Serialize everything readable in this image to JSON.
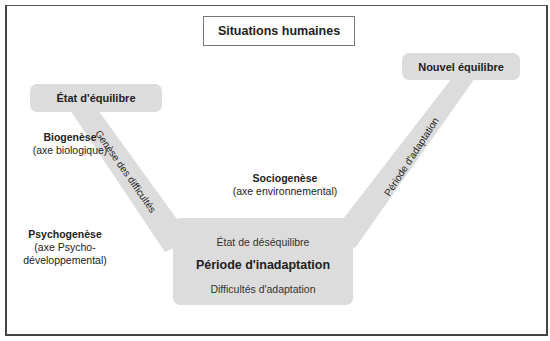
{
  "diagram": {
    "title": "Situations humaines",
    "states": {
      "initial": "État d'équilibre",
      "final": "Nouvel équilibre"
    },
    "center": {
      "line1": "État de déséquilibre",
      "line2": "Période d'inadaptation",
      "line3": "Difficultés d'adaptation"
    },
    "connectors": {
      "left": "Genèse des difficultés",
      "right": "Période d'adaptation"
    },
    "axes": [
      {
        "name": "Biogenèse",
        "desc": "(axe biologique)"
      },
      {
        "name": "Sociogenèse",
        "desc": "(axe environnemental)"
      },
      {
        "name": "Psychogenèse",
        "desc1": "(axe Psycho-",
        "desc2": "développemental)"
      }
    ],
    "colors": {
      "shape_fill": "#dcdcdc",
      "frame": "#444444",
      "text": "#222222"
    }
  }
}
